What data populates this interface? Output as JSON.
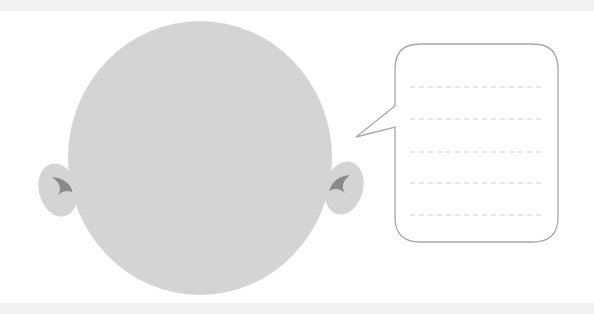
{
  "illustration": {
    "subject": "bald head outline with speech bubble",
    "colors": {
      "head": "#d4d4d4",
      "ear_detail": "#8a8a8a",
      "bubble_stroke": "#a8a8a8",
      "bubble_fill": "#ffffff",
      "dash_lines": "#cfcfcf",
      "band": "#f2f2f2"
    },
    "speech_bubble": {
      "line_count": 5,
      "text_lines": [
        "",
        "",
        "",
        "",
        ""
      ]
    }
  }
}
